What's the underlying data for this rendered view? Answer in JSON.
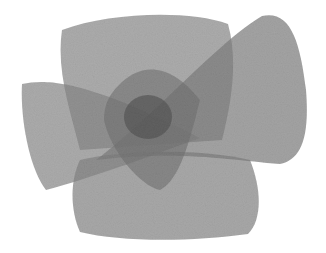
{
  "artwork": {
    "description": "Abstract watercolor of overlapping translucent gray shapes",
    "colors": {
      "background": "#ffffff",
      "light_wash": "#9a9a9a",
      "mid_wash": "#7e7e7e",
      "dark_center": "#5a5a5a"
    }
  }
}
